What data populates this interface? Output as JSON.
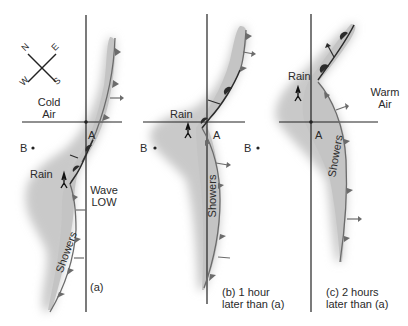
{
  "colors": {
    "shading": "#c9c9c9",
    "front": "#6b6b6b",
    "warm_front_marker": "#2b2b2b",
    "axis": "#222222",
    "text": "#2a2a2a"
  },
  "compass": {
    "n": "N",
    "e": "E",
    "w": "W",
    "s": "S"
  },
  "panel_a": {
    "cold_air": [
      "Cold",
      "Air"
    ],
    "point_a": "A",
    "point_b": "B",
    "rain": "Rain",
    "wave_low": [
      "Wave",
      "LOW"
    ],
    "showers": "Showers",
    "caption": "(a)"
  },
  "panel_b": {
    "rain": "Rain",
    "point_a": "A",
    "point_b_left": "B",
    "point_b_right": "B",
    "showers": "Showers",
    "caption": [
      "(b) 1 hour",
      "later than (a)"
    ]
  },
  "panel_c": {
    "rain": "Rain",
    "warm_air": [
      "Warm",
      "Air"
    ],
    "point_a": "A",
    "showers": "Showers",
    "caption": [
      "(c) 2 hours",
      "later than (a)"
    ]
  }
}
